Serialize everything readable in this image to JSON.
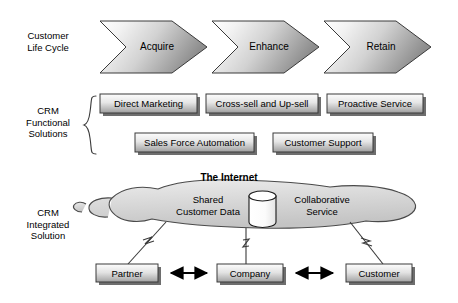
{
  "diagram": {
    "rows": [
      {
        "id": "lifecycle",
        "label": "Customer\nLife Cycle"
      },
      {
        "id": "functional",
        "label": "CRM\nFunctional\nSolutions"
      },
      {
        "id": "integrated",
        "label": "CRM\nIntegrated\nSolution"
      }
    ]
  },
  "lifecycle": {
    "stages": [
      {
        "label": "Acquire"
      },
      {
        "label": "Enhance"
      },
      {
        "label": "Retain"
      }
    ]
  },
  "functional": {
    "row1": [
      {
        "label": "Direct Marketing"
      },
      {
        "label": "Cross-sell and Up-sell"
      },
      {
        "label": "Proactive Service"
      }
    ],
    "row2": [
      {
        "label": "Sales Force Automation"
      },
      {
        "label": "Customer Support"
      }
    ]
  },
  "integrated": {
    "internet_title": "The Internet",
    "cloud_left_label": "Shared\nCustomer Data",
    "cloud_right_label": "Collaborative\nService",
    "database_icon": "database-cylinder-icon",
    "nodes": [
      {
        "label": "Partner"
      },
      {
        "label": "Company"
      },
      {
        "label": "Customer"
      }
    ],
    "connectors": [
      {
        "from": "Partner",
        "to": "Company",
        "style": "double-arrow"
      },
      {
        "from": "Company",
        "to": "Customer",
        "style": "double-arrow"
      }
    ],
    "cloud_links": [
      {
        "node": "Partner",
        "style": "lightning-link"
      },
      {
        "node": "Company",
        "style": "lightning-link"
      },
      {
        "node": "Customer",
        "style": "lightning-link"
      }
    ]
  },
  "colors": {
    "outline": "#3a3a3a",
    "arrow_fill_light": "#fbfbfb",
    "arrow_fill_dark": "#9a9a9a",
    "box_fill_light": "#f4f4f4",
    "box_fill_dark": "#a8a8a8",
    "cloud_fill": "#d8d8d8",
    "shadow": "#6e6e6e",
    "text": "#000000"
  }
}
